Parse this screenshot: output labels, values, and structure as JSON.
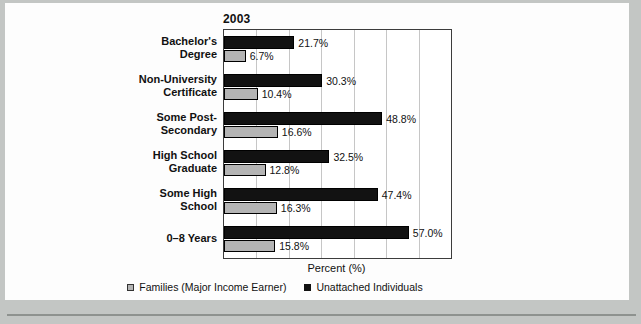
{
  "figure": {
    "page_background": "#c3c6c4",
    "panel_background": "#fdfdfd",
    "bottom_rule_color": "#8e928f"
  },
  "chart_data": {
    "type": "bar",
    "orientation": "horizontal",
    "title": "2003",
    "xlabel": "Percent (%)",
    "xlim": [
      0,
      70
    ],
    "grid_step": 10,
    "grid": true,
    "legend_position": "bottom",
    "gridline_color": "#c6c6c6",
    "categories": [
      {
        "label": "Bachelor's Degree",
        "lines": [
          "Bachelor's",
          "Degree"
        ]
      },
      {
        "label": "Non-University Certificate",
        "lines": [
          "Non-University",
          "Certificate"
        ]
      },
      {
        "label": "Some Post-Secondary",
        "lines": [
          "Some Post-",
          "Secondary"
        ]
      },
      {
        "label": "High School Graduate",
        "lines": [
          "High School",
          "Graduate"
        ]
      },
      {
        "label": "Some High School",
        "lines": [
          "Some High",
          "School"
        ]
      },
      {
        "label": "0–8 Years",
        "lines": [
          "0–8 Years"
        ]
      }
    ],
    "series": [
      {
        "name": "Unattached Individuals",
        "color": "#121212",
        "values": [
          21.7,
          30.3,
          48.8,
          32.5,
          47.4,
          57.0
        ],
        "value_labels": [
          "21.7%",
          "30.3%",
          "48.8%",
          "32.5%",
          "47.4%",
          "57.0%"
        ]
      },
      {
        "name": "Families (Major Income Earner)",
        "color": "#b4b4b4",
        "values": [
          6.7,
          10.4,
          16.6,
          12.8,
          16.3,
          15.8
        ],
        "value_labels": [
          "6.7%",
          "10.4%",
          "16.6%",
          "12.8%",
          "16.3%",
          "15.8%"
        ]
      }
    ]
  },
  "legend": {
    "items": [
      {
        "label": "Families (Major Income Earner)",
        "swatch": "gray"
      },
      {
        "label": "Unattached Individuals",
        "swatch": "black"
      }
    ]
  }
}
